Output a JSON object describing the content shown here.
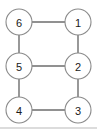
{
  "figure": {
    "title": "",
    "background_color": "#ffffff",
    "node_fill": "#ffffff",
    "node_stroke": "#8a8a8a",
    "edge_color": "#6d6d6d",
    "label_color": "#1a1a1a",
    "node_radius": 13
  },
  "diagram": {
    "type": "undirected-graph",
    "node_count": 6,
    "edge_count": 7,
    "nodes": [
      {
        "id": "6",
        "label": "6",
        "cx": 19,
        "cy": 22
      },
      {
        "id": "1",
        "label": "1",
        "cx": 78,
        "cy": 22
      },
      {
        "id": "5",
        "label": "5",
        "cx": 19,
        "cy": 66
      },
      {
        "id": "2",
        "label": "2",
        "cx": 78,
        "cy": 66
      },
      {
        "id": "4",
        "label": "4",
        "cx": 19,
        "cy": 110
      },
      {
        "id": "3",
        "label": "3",
        "cx": 78,
        "cy": 110
      }
    ],
    "edges": [
      {
        "from": "6",
        "to": "1",
        "x1": 32,
        "y1": 22,
        "x2": 65,
        "y2": 22
      },
      {
        "from": "5",
        "to": "2",
        "x1": 32,
        "y1": 66,
        "x2": 65,
        "y2": 66
      },
      {
        "from": "4",
        "to": "3",
        "x1": 32,
        "y1": 110,
        "x2": 65,
        "y2": 110
      },
      {
        "from": "6",
        "to": "5",
        "x1": 19,
        "y1": 35,
        "x2": 19,
        "y2": 53
      },
      {
        "from": "5",
        "to": "4",
        "x1": 19,
        "y1": 79,
        "x2": 19,
        "y2": 97
      },
      {
        "from": "1",
        "to": "2",
        "x1": 78,
        "y1": 35,
        "x2": 78,
        "y2": 53
      },
      {
        "from": "2",
        "to": "3",
        "x1": 78,
        "y1": 79,
        "x2": 78,
        "y2": 97
      }
    ],
    "baseline": {
      "x1": 0,
      "y1": 128,
      "x2": 97,
      "y2": 128
    }
  }
}
